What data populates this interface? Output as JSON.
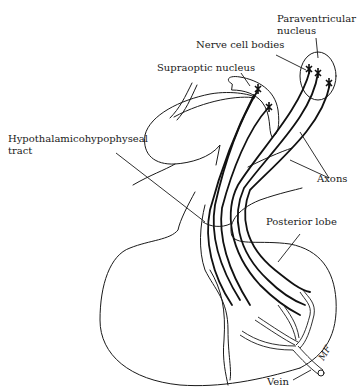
{
  "diagram": {
    "type": "anatomical-illustration",
    "labels": {
      "paraventricular": [
        "Paraventricular",
        "nucleus"
      ],
      "nerve_cell_bodies": "Nerve cell bodies",
      "supraoptic": "Supraoptic nucleus",
      "tract": [
        "Hypothalamicohypophyseal",
        "tract"
      ],
      "axons": "Axons",
      "posterior_lobe": "Posterior lobe",
      "vein": "Vein",
      "signature": "MF"
    },
    "colors": {
      "line": "#1a1a1a",
      "background": "#ffffff"
    }
  }
}
